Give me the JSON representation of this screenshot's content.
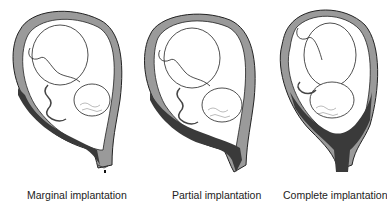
{
  "diagram": {
    "panels": [
      {
        "id": "marginal",
        "caption": "Marginal implantation",
        "placenta_coverage": "edge of cervical os"
      },
      {
        "id": "partial",
        "caption": "Partial implantation",
        "placenta_coverage": "partially covers cervical os"
      },
      {
        "id": "complete",
        "caption": "Complete implantation",
        "placenta_coverage": "fully covers cervical os"
      }
    ],
    "colors": {
      "uterine_wall": "#9a9a9a",
      "placenta": "#3a3a3a",
      "line": "#222222",
      "background": "#ffffff"
    }
  }
}
